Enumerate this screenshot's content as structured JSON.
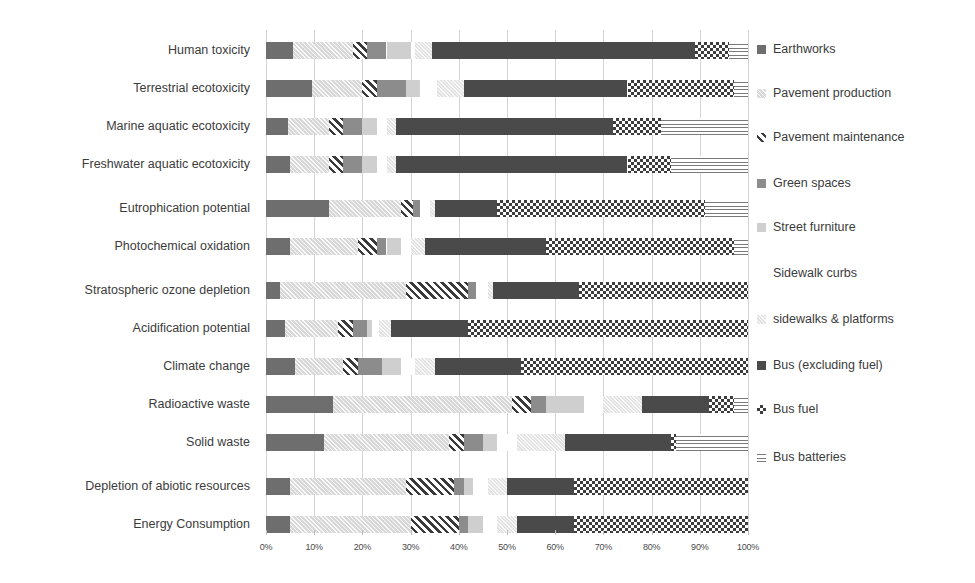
{
  "chart_data": {
    "type": "bar",
    "subtype": "horizontal-stacked-100-percent",
    "title": "",
    "subtitle": "",
    "xlabel": "",
    "ylabel": "",
    "xlim": [
      0,
      100
    ],
    "grid": true,
    "legend_position": "right",
    "xticks": [
      "0%",
      "10%",
      "20%",
      "30%",
      "40%",
      "50%",
      "60%",
      "70%",
      "80%",
      "90%",
      "100%"
    ],
    "xtick_values": [
      0,
      10,
      20,
      30,
      40,
      50,
      60,
      70,
      80,
      90,
      100
    ],
    "categories": [
      "Human toxicity",
      "Terrestrial ecotoxicity",
      "Marine aquatic ecotoxicity",
      "Freshwater aquatic ecotoxicity",
      "Eutrophication potential",
      "Photochemical oxidation",
      "Stratospheric ozone depletion",
      "Acidification potential",
      "Climate change",
      "Radioactive waste",
      "Solid waste",
      "Depletion of abiotic resources",
      "Energy Consumption"
    ],
    "series": [
      {
        "name": "Earthworks",
        "key": "earthworks",
        "fill": "solid-mid-gray",
        "color": "#6e6e6e",
        "values": [
          5.5,
          9.5,
          4.5,
          5.0,
          13.0,
          5.0,
          3.0,
          4.0,
          6.0,
          14.0,
          12.0,
          5.0,
          5.0
        ]
      },
      {
        "name": "Pavement production",
        "key": "pavement_production",
        "fill": "light-speckle",
        "color": "#d8d8d8",
        "values": [
          12.5,
          10.5,
          8.5,
          8.0,
          15.0,
          14.0,
          26.0,
          11.0,
          10.0,
          37.0,
          26.0,
          24.0,
          25.0
        ]
      },
      {
        "name": "Pavement maintenance",
        "key": "pavement_maintenance",
        "fill": "diagonal-hatch",
        "color": "#3a3a3a",
        "values": [
          3.0,
          3.0,
          3.0,
          3.0,
          2.5,
          4.0,
          13.0,
          3.0,
          3.0,
          4.0,
          3.0,
          10.0,
          10.0
        ]
      },
      {
        "name": "Green spaces",
        "key": "green_spaces",
        "fill": "solid-gray",
        "color": "#8c8c8c",
        "values": [
          4.0,
          6.0,
          4.0,
          4.0,
          1.5,
          2.0,
          1.5,
          3.0,
          5.0,
          3.0,
          4.0,
          2.0,
          2.0
        ]
      },
      {
        "name": "Street furniture",
        "key": "street_furniture",
        "fill": "solid-light-gray",
        "color": "#cfcfcf",
        "values": [
          5.0,
          3.0,
          3.0,
          3.0,
          0.0,
          3.0,
          0.0,
          1.0,
          4.0,
          8.0,
          3.0,
          2.0,
          3.0
        ]
      },
      {
        "name": "Sidewalk curbs",
        "key": "sidewalk_curbs",
        "fill": "white",
        "color": "#ffffff",
        "values": [
          1.0,
          3.5,
          2.0,
          2.0,
          2.0,
          2.0,
          2.5,
          1.5,
          3.0,
          4.0,
          4.0,
          3.0,
          3.0
        ]
      },
      {
        "name": "sidewalks & platforms",
        "key": "sidewalks_platforms",
        "fill": "pale-speckle",
        "color": "#e3e3e3",
        "values": [
          3.5,
          5.5,
          2.0,
          2.0,
          1.0,
          3.0,
          1.0,
          2.5,
          4.0,
          8.0,
          10.0,
          4.0,
          4.0
        ]
      },
      {
        "name": "Bus (excluding fuel)",
        "key": "bus_excluding_fuel",
        "fill": "solid-dark",
        "color": "#4a4a4a",
        "values": [
          54.5,
          34.0,
          45.0,
          48.0,
          13.0,
          25.0,
          18.0,
          16.0,
          18.0,
          14.0,
          22.0,
          14.0,
          12.0
        ]
      },
      {
        "name": "Bus fuel",
        "key": "bus_fuel",
        "fill": "checkerboard",
        "color": "#3d3d3d",
        "values": [
          7.0,
          22.0,
          10.0,
          9.0,
          43.0,
          39.0,
          35.0,
          58.0,
          47.0,
          5.0,
          1.0,
          36.0,
          36.0
        ]
      },
      {
        "name": "Bus batteries",
        "key": "bus_batteries",
        "fill": "horizontal-lines",
        "color": "#7a7a7a",
        "values": [
          4.0,
          3.0,
          18.0,
          16.0,
          9.0,
          3.0,
          0.0,
          0.0,
          0.0,
          3.0,
          15.0,
          0.0,
          0.0
        ]
      }
    ]
  },
  "legend": {
    "items": [
      {
        "label": "Earthworks"
      },
      {
        "label": "Pavement production"
      },
      {
        "label": "Pavement maintenance"
      },
      {
        "label": "Green spaces"
      },
      {
        "label": "Street furniture"
      },
      {
        "label": "Sidewalk curbs"
      },
      {
        "label": "sidewalks & platforms"
      },
      {
        "label": "Bus (excluding fuel)"
      },
      {
        "label": "Bus fuel"
      },
      {
        "label": "Bus batteries"
      }
    ]
  }
}
